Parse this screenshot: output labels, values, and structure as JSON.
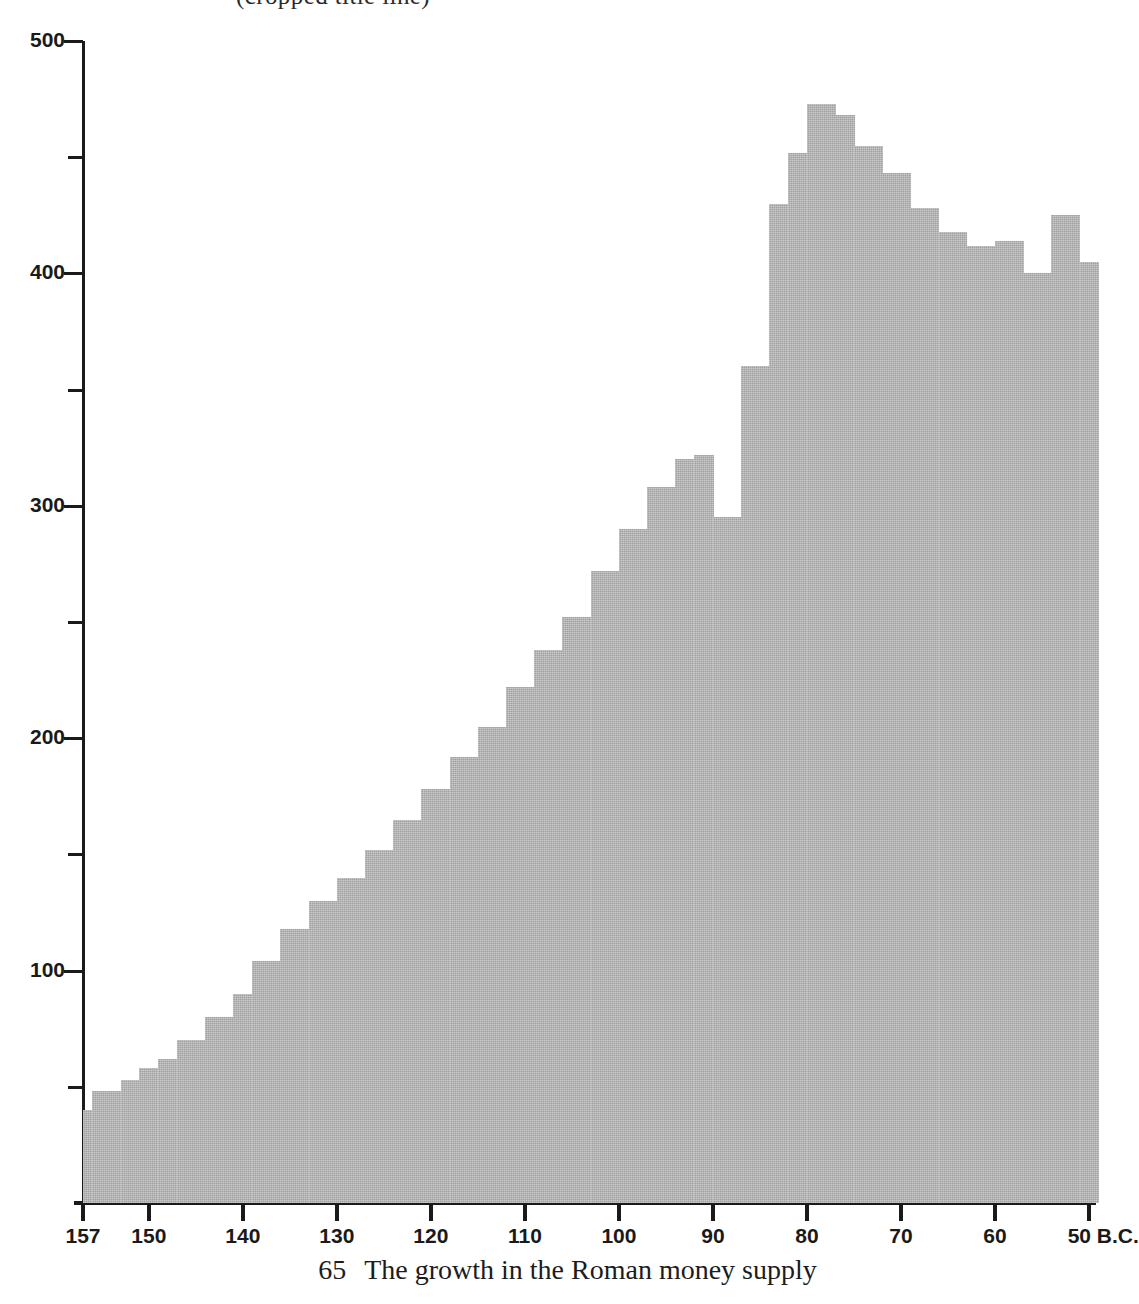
{
  "figure": {
    "caption_number": "65",
    "caption_text": "The growth in the Roman money supply",
    "cropped_title_fragment": "(cropped title line)",
    "bar_color": "#b3b3b3",
    "axis_color": "#1a1a1a",
    "background_color": "#ffffff"
  },
  "chart_data": {
    "type": "bar",
    "title": "The growth in the Roman money supply",
    "xlabel": "B.C.",
    "ylabel": "",
    "ylim": [
      0,
      500
    ],
    "xlim": [
      157,
      49
    ],
    "grid": false,
    "legend": null,
    "x_axis": {
      "unit_suffix": "B.C.",
      "major_ticks": [
        157,
        150,
        140,
        130,
        120,
        110,
        100,
        90,
        80,
        70,
        60,
        50
      ],
      "tick_labels": [
        "157",
        "150",
        "140",
        "130",
        "120",
        "110",
        "100",
        "90",
        "80",
        "70",
        "60",
        "50 B.C."
      ],
      "direction": "descending"
    },
    "y_axis": {
      "major_ticks": [
        100,
        200,
        300,
        400,
        500
      ],
      "major_tick_labels": [
        "100",
        "200",
        "300",
        "400",
        "500"
      ],
      "minor_ticks": [
        50,
        150,
        250,
        350,
        450
      ]
    },
    "categories": [
      "157",
      "155",
      "152",
      "150",
      "148",
      "145",
      "142",
      "140",
      "137",
      "134",
      "131",
      "128",
      "125",
      "122",
      "119",
      "116",
      "113",
      "110",
      "107",
      "104",
      "101",
      "98",
      "95",
      "93",
      "91",
      "88",
      "85",
      "82",
      "81",
      "79",
      "76",
      "73",
      "70",
      "67",
      "64",
      "61",
      "58",
      "55",
      "52",
      "50"
    ],
    "values": [
      40,
      48,
      53,
      58,
      62,
      70,
      80,
      90,
      104,
      118,
      130,
      140,
      152,
      165,
      178,
      192,
      205,
      222,
      238,
      252,
      272,
      290,
      308,
      320,
      322,
      295,
      360,
      430,
      452,
      473,
      468,
      455,
      443,
      428,
      418,
      412,
      414,
      400,
      425,
      405
    ],
    "bar_spans_bc": [
      [
        157,
        156
      ],
      [
        156,
        153
      ],
      [
        153,
        151
      ],
      [
        151,
        149
      ],
      [
        149,
        147
      ],
      [
        147,
        144
      ],
      [
        144,
        141
      ],
      [
        141,
        139
      ],
      [
        139,
        136
      ],
      [
        136,
        133
      ],
      [
        133,
        130
      ],
      [
        130,
        127
      ],
      [
        127,
        124
      ],
      [
        124,
        121
      ],
      [
        121,
        118
      ],
      [
        118,
        115
      ],
      [
        115,
        112
      ],
      [
        112,
        109
      ],
      [
        109,
        106
      ],
      [
        106,
        103
      ],
      [
        103,
        100
      ],
      [
        100,
        97
      ],
      [
        97,
        94
      ],
      [
        94,
        92
      ],
      [
        92,
        90
      ],
      [
        90,
        87
      ],
      [
        87,
        84
      ],
      [
        84,
        82
      ],
      [
        82,
        80
      ],
      [
        80,
        77
      ],
      [
        77,
        75
      ],
      [
        75,
        72
      ],
      [
        72,
        69
      ],
      [
        69,
        66
      ],
      [
        66,
        63
      ],
      [
        63,
        60
      ],
      [
        60,
        57
      ],
      [
        57,
        54
      ],
      [
        54,
        51
      ],
      [
        51,
        49
      ]
    ],
    "peak": {
      "year": "79",
      "value": 473
    },
    "trough_after_peak_rise": {
      "year": "88",
      "value": 295
    },
    "start": {
      "year": "157",
      "value": 40
    },
    "end": {
      "year": "50",
      "value": 405
    }
  }
}
